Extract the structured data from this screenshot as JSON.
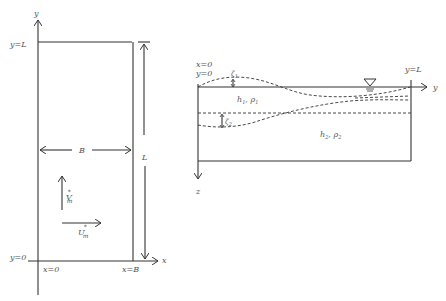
{
  "left_figure": {
    "axis_y_label": "y",
    "axis_x_label": "x",
    "top_label": "y=L",
    "bottom_label": "y=0",
    "x0_label": "x=0",
    "xB_label": "x=B",
    "width_label": "B",
    "length_label": "L",
    "v_label": "V",
    "v_sub": "m",
    "u_label": "U",
    "u_sub": "m",
    "star": "*"
  },
  "right_figure": {
    "x0_label": "x=0",
    "y0_label": "y=0",
    "yL_label": "y=L",
    "axis_y_label": "y",
    "axis_z_label": "z",
    "zeta1_label": "ζ",
    "zeta1_sub": "1",
    "zeta2_label": "ζ",
    "zeta2_sub": "2",
    "layer1_label": "h",
    "layer1_sub": "1",
    "layer1_rho": "ρ",
    "layer1_rho_sub": "1",
    "layer2_label": "h",
    "layer2_sub": "2",
    "layer2_rho": "ρ",
    "layer2_rho_sub": "2",
    "free_surface_symbol": "▽"
  }
}
